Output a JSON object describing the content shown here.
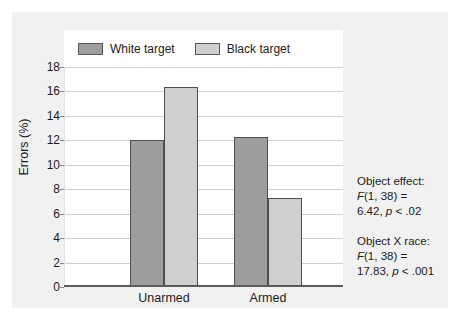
{
  "chart_data": {
    "type": "bar",
    "title": "",
    "xlabel": "",
    "ylabel": "Errors (%)",
    "ylim": [
      0,
      18
    ],
    "ytick_step": 2,
    "grid": true,
    "legend_position": "top",
    "categories": [
      "Unarmed",
      "Armed"
    ],
    "series": [
      {
        "name": "White target",
        "color": "#9e9e9e",
        "values": [
          12.0,
          12.3
        ]
      },
      {
        "name": "Black target",
        "color": "#cfcfcf",
        "values": [
          16.4,
          7.3
        ]
      }
    ],
    "ytick_labels": [
      "18",
      "16",
      "14",
      "12",
      "10",
      "8",
      "6",
      "4",
      "2",
      "0"
    ],
    "ytick_values": [
      18,
      16,
      14,
      12,
      10,
      8,
      6,
      4,
      2,
      0
    ],
    "annotations": [
      {
        "lines": [
          {
            "text": "Object effect:",
            "style": "normal"
          },
          {
            "text": "F(1, 38) =",
            "style": "stat"
          },
          {
            "text": "6.42, p < .02",
            "style": "stat"
          }
        ]
      },
      {
        "lines": [
          {
            "text": "Object X race:",
            "style": "normal"
          },
          {
            "text": "F(1, 38) =",
            "style": "stat"
          },
          {
            "text": "17.83, p < .001",
            "style": "stat"
          }
        ]
      }
    ]
  },
  "legend": {
    "items": [
      {
        "label": "White target",
        "color": "#9e9e9e"
      },
      {
        "label": "Black target",
        "color": "#cfcfcf"
      }
    ]
  },
  "axes": {
    "y_title": "Errors (%)",
    "x_categories": [
      "Unarmed",
      "Armed"
    ]
  },
  "annotations": {
    "block1": {
      "line1": "Object effect:",
      "line2_f": "F",
      "line2_rest": "(1, 38) =",
      "line3_num": "6.42, ",
      "line3_p": "p",
      "line3_tail": " < .02"
    },
    "block2": {
      "line1": "Object X race:",
      "line2_f": "F",
      "line2_rest": "(1, 38) =",
      "line3_num": "17.83, ",
      "line3_p": "p",
      "line3_tail": " < .001"
    }
  },
  "colors": {
    "figure_background": "#f1f1f1",
    "plot_background": "#ffffff",
    "gridline": "#cfcfcf",
    "axis": "#5b5b5b",
    "bar_white_target": "#9e9e9e",
    "bar_black_target": "#cfcfcf",
    "bar_edge": "#4f4f4f",
    "text": "#1c1c1c"
  }
}
